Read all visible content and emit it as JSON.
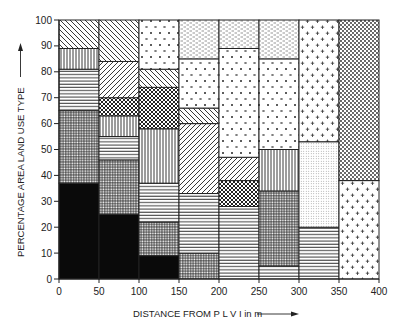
{
  "chart_data": {
    "type": "bar",
    "subtype": "stacked-100-percent-columns",
    "title": "",
    "xlabel": "DISTANCE FROM P L V I in m",
    "ylabel": "PERCENTAGE AREA LAND USE TYPE",
    "xlim": [
      0,
      400
    ],
    "ylim": [
      0,
      100
    ],
    "x_ticks": [
      "0",
      "50",
      "100",
      "150",
      "200",
      "250",
      "300",
      "350",
      "400"
    ],
    "y_ticks": [
      "0",
      "10",
      "20",
      "30",
      "40",
      "50",
      "60",
      "70",
      "80",
      "90",
      "100"
    ],
    "grid": false,
    "legend": "none",
    "categories": [
      "0-50",
      "50-100",
      "100-150",
      "150-200",
      "200-250",
      "250-300",
      "300-350",
      "350-400"
    ],
    "columns": [
      {
        "range": [
          0,
          50
        ],
        "segments": [
          {
            "pattern": "solid-black",
            "from": 0,
            "to": 37
          },
          {
            "pattern": "grid",
            "from": 37,
            "to": 65
          },
          {
            "pattern": "horizontal",
            "from": 65,
            "to": 81
          },
          {
            "pattern": "vertical",
            "from": 81,
            "to": 89
          },
          {
            "pattern": "diag-back",
            "from": 89,
            "to": 100
          }
        ]
      },
      {
        "range": [
          50,
          100
        ],
        "segments": [
          {
            "pattern": "solid-black",
            "from": 0,
            "to": 25
          },
          {
            "pattern": "grid",
            "from": 25,
            "to": 46
          },
          {
            "pattern": "horizontal",
            "from": 46,
            "to": 55
          },
          {
            "pattern": "vertical",
            "from": 55,
            "to": 63
          },
          {
            "pattern": "crosshatch",
            "from": 63,
            "to": 70
          },
          {
            "pattern": "diag-forward",
            "from": 70,
            "to": 84
          },
          {
            "pattern": "diag-back",
            "from": 84,
            "to": 100
          }
        ]
      },
      {
        "range": [
          100,
          150
        ],
        "segments": [
          {
            "pattern": "solid-black",
            "from": 0,
            "to": 9
          },
          {
            "pattern": "grid",
            "from": 9,
            "to": 22
          },
          {
            "pattern": "horizontal",
            "from": 22,
            "to": 37
          },
          {
            "pattern": "vertical",
            "from": 37,
            "to": 58
          },
          {
            "pattern": "crosshatch",
            "from": 58,
            "to": 74
          },
          {
            "pattern": "diag-back",
            "from": 74,
            "to": 81
          },
          {
            "pattern": "x-marks",
            "from": 81,
            "to": 100
          }
        ]
      },
      {
        "range": [
          150,
          200
        ],
        "segments": [
          {
            "pattern": "grid",
            "from": 0,
            "to": 10
          },
          {
            "pattern": "horizontal",
            "from": 10,
            "to": 33
          },
          {
            "pattern": "diag-forward",
            "from": 33,
            "to": 60
          },
          {
            "pattern": "diag-back",
            "from": 60,
            "to": 66
          },
          {
            "pattern": "x-marks",
            "from": 66,
            "to": 85
          },
          {
            "pattern": "dashes",
            "from": 85,
            "to": 100
          }
        ]
      },
      {
        "range": [
          200,
          250
        ],
        "segments": [
          {
            "pattern": "horizontal",
            "from": 0,
            "to": 28
          },
          {
            "pattern": "crosshatch",
            "from": 28,
            "to": 38
          },
          {
            "pattern": "diag-forward",
            "from": 38,
            "to": 47
          },
          {
            "pattern": "x-marks",
            "from": 47,
            "to": 89
          },
          {
            "pattern": "dashes",
            "from": 89,
            "to": 100
          }
        ]
      },
      {
        "range": [
          250,
          300
        ],
        "segments": [
          {
            "pattern": "horizontal",
            "from": 0,
            "to": 5
          },
          {
            "pattern": "grid",
            "from": 5,
            "to": 34
          },
          {
            "pattern": "vertical",
            "from": 34,
            "to": 50
          },
          {
            "pattern": "x-marks",
            "from": 50,
            "to": 85
          },
          {
            "pattern": "dashes",
            "from": 85,
            "to": 100
          }
        ]
      },
      {
        "range": [
          300,
          350
        ],
        "segments": [
          {
            "pattern": "horizontal",
            "from": 0,
            "to": 20
          },
          {
            "pattern": "fine-dots",
            "from": 20,
            "to": 53
          },
          {
            "pattern": "plus-marks",
            "from": 53,
            "to": 100
          }
        ]
      },
      {
        "range": [
          350,
          400
        ],
        "segments": [
          {
            "pattern": "plus-marks",
            "from": 0,
            "to": 38
          },
          {
            "pattern": "coarse-dots",
            "from": 38,
            "to": 100
          }
        ]
      }
    ]
  }
}
